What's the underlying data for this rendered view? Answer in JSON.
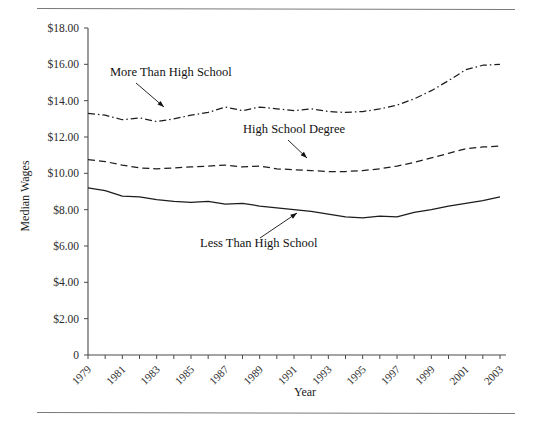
{
  "figure": {
    "top_rule": true,
    "bottom_rule": true
  },
  "chart_data": {
    "type": "line",
    "title": "",
    "xlabel": "Year",
    "ylabel": "Median Wages",
    "grid": false,
    "legend_position": "inline-annotations",
    "xlim": [
      1979,
      2003
    ],
    "ylim": [
      0,
      18
    ],
    "ytick_labels": [
      "$18.00",
      "$16.00",
      "$14.00",
      "$12.00",
      "$10.00",
      "$8.00",
      "$6.00",
      "$4.00",
      "$2.00",
      "0"
    ],
    "ytick_values": [
      18,
      16,
      14,
      12,
      10,
      8,
      6,
      4,
      2,
      0
    ],
    "xtick_labels": [
      "1979",
      "1981",
      "1983",
      "1985",
      "1987",
      "1989",
      "1991",
      "1993",
      "1995",
      "1997",
      "1999",
      "2001",
      "2003"
    ],
    "xtick_values": [
      1979,
      1981,
      1983,
      1985,
      1987,
      1989,
      1991,
      1993,
      1995,
      1997,
      1999,
      2001,
      2003
    ],
    "x": [
      1979,
      1980,
      1981,
      1982,
      1983,
      1984,
      1985,
      1986,
      1987,
      1988,
      1989,
      1990,
      1991,
      1992,
      1993,
      1994,
      1995,
      1996,
      1997,
      1998,
      1999,
      2000,
      2001,
      2002,
      2003
    ],
    "series": [
      {
        "name": "More Than High School",
        "style": "dash-dot",
        "values": [
          13.3,
          13.2,
          12.95,
          13.05,
          12.85,
          13.0,
          13.2,
          13.35,
          13.65,
          13.45,
          13.65,
          13.55,
          13.45,
          13.55,
          13.4,
          13.35,
          13.4,
          13.55,
          13.75,
          14.1,
          14.55,
          15.1,
          15.7,
          15.95,
          16.0
        ]
      },
      {
        "name": "High School Degree",
        "style": "dashed",
        "values": [
          10.75,
          10.65,
          10.45,
          10.3,
          10.25,
          10.3,
          10.35,
          10.4,
          10.45,
          10.35,
          10.4,
          10.25,
          10.2,
          10.15,
          10.1,
          10.1,
          10.15,
          10.25,
          10.4,
          10.6,
          10.85,
          11.1,
          11.35,
          11.45,
          11.5
        ]
      },
      {
        "name": "Less Than High School",
        "style": "solid",
        "values": [
          9.2,
          9.05,
          8.75,
          8.7,
          8.55,
          8.45,
          8.4,
          8.45,
          8.3,
          8.35,
          8.2,
          8.1,
          8.0,
          7.9,
          7.75,
          7.6,
          7.55,
          7.65,
          7.6,
          7.85,
          8.0,
          8.2,
          8.35,
          8.5,
          8.7
        ]
      }
    ],
    "annotations": [
      {
        "text": "More Than High School",
        "label_x": 110,
        "label_y": 76,
        "arrow_from_x": 136,
        "arrow_from_y": 83,
        "arrow_to_x": 164,
        "arrow_to_y": 107
      },
      {
        "text": "High School Degree",
        "label_x": 243,
        "label_y": 133,
        "arrow_from_x": 288,
        "arrow_from_y": 140,
        "arrow_to_x": 307,
        "arrow_to_y": 158
      },
      {
        "text": "Less Than High School",
        "label_x": 200,
        "label_y": 247,
        "arrow_from_x": 260,
        "arrow_from_y": 238,
        "arrow_to_x": 297,
        "arrow_to_y": 213
      }
    ]
  }
}
